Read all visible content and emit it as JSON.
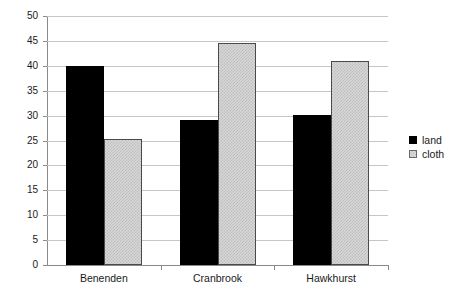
{
  "chart_data": {
    "type": "bar",
    "title": "",
    "xlabel": "",
    "ylabel": "",
    "categories": [
      "Benenden",
      "Cranbrook",
      "Hawkhurst"
    ],
    "series": [
      {
        "name": "land",
        "color": "#000000",
        "values": [
          40.0,
          29.2,
          30.2
        ]
      },
      {
        "name": "cloth",
        "color": "#d8d8d8",
        "values": [
          25.3,
          44.5,
          41.0
        ]
      }
    ],
    "ylim": [
      0,
      50
    ],
    "ytick_step": 5,
    "yticks": [
      "0",
      "5",
      "10",
      "15",
      "20",
      "25",
      "30",
      "35",
      "40",
      "45",
      "50"
    ],
    "grid": "horizontal",
    "legend_position": "right"
  },
  "legend": {
    "items": [
      {
        "label": "land"
      },
      {
        "label": "cloth"
      }
    ]
  },
  "artifacts": {
    "top_cropped_text": "·    ·        ·        · ·"
  }
}
